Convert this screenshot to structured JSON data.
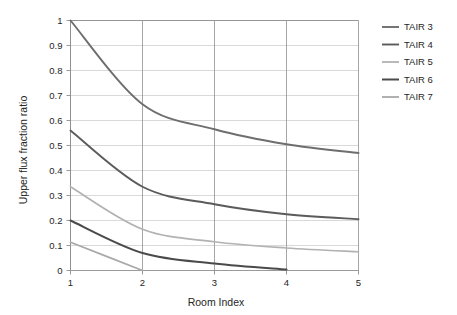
{
  "chart_data": {
    "type": "line",
    "title": "",
    "xlabel": "Room Index",
    "ylabel": "Upper flux fraction ratio",
    "x": [
      1,
      2,
      3,
      4,
      5
    ],
    "xlim": [
      1,
      5
    ],
    "ylim": [
      0,
      1
    ],
    "xticks": [
      "1",
      "2",
      "3",
      "4",
      "5"
    ],
    "yticks": [
      "0",
      "0.1",
      "0.2",
      "0.3",
      "0.4",
      "0.5",
      "0.6",
      "0.7",
      "0.8",
      "0.9",
      "1"
    ],
    "grid": "horizontal-and-vertical",
    "legend_position": "right",
    "series": [
      {
        "name": "TAIR 3",
        "color": "#6e6e6e",
        "width": 1.9,
        "values": [
          1.0,
          0.665,
          0.565,
          0.505,
          0.47
        ]
      },
      {
        "name": "TAIR 4",
        "color": "#5b5b5b",
        "width": 1.9,
        "values": [
          0.56,
          0.335,
          0.265,
          0.225,
          0.205
        ]
      },
      {
        "name": "TAIR 5",
        "color": "#b2b2b2",
        "width": 1.7,
        "values": [
          0.335,
          0.165,
          0.115,
          0.09,
          0.075
        ]
      },
      {
        "name": "TAIR 6",
        "color": "#4a4a4a",
        "width": 2.0,
        "values": [
          0.2,
          0.07,
          0.028,
          0.004,
          null
        ]
      },
      {
        "name": "TAIR 7",
        "color": "#a9a9a9",
        "width": 1.7,
        "values": [
          0.113,
          0.0,
          null,
          null,
          null
        ]
      }
    ]
  },
  "axes": {
    "x_title": "Room Index",
    "y_title": "Upper flux fraction ratio"
  },
  "legend": {
    "items": [
      {
        "label": "TAIR 3"
      },
      {
        "label": "TAIR 4"
      },
      {
        "label": "TAIR 5"
      },
      {
        "label": "TAIR 6"
      },
      {
        "label": "TAIR 7"
      }
    ]
  }
}
